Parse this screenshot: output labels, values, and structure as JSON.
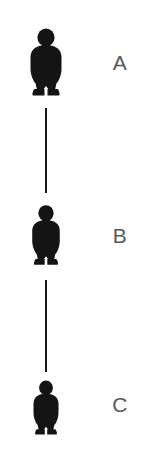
{
  "diagram": {
    "type": "vertical-chain",
    "background_color": "#ffffff",
    "figure_color": "#141414",
    "label_color": "#58585a",
    "connector_color": "#1a1a1a",
    "nodes": [
      {
        "id": "a",
        "label": "A",
        "icon": "person-silhouette-icon",
        "center_x": 46,
        "top": 28,
        "width": 36,
        "height": 68,
        "label_x": 120,
        "label_y": 62,
        "label_size": 21
      },
      {
        "id": "b",
        "label": "B",
        "icon": "person-silhouette-icon",
        "center_x": 46,
        "top": 200,
        "width": 32,
        "height": 70,
        "label_x": 120,
        "label_y": 235,
        "label_size": 21
      },
      {
        "id": "c",
        "label": "C",
        "icon": "person-silhouette-icon",
        "center_x": 46,
        "top": 378,
        "width": 29,
        "height": 59,
        "label_x": 120,
        "label_y": 404,
        "label_size": 21
      }
    ],
    "connectors": [
      {
        "id": "a-b",
        "from": "a",
        "to": "b",
        "center_x": 46,
        "top": 108,
        "height": 85,
        "thickness": 2
      },
      {
        "id": "b-c",
        "from": "b",
        "to": "c",
        "center_x": 46,
        "top": 280,
        "height": 92,
        "thickness": 2
      }
    ]
  }
}
